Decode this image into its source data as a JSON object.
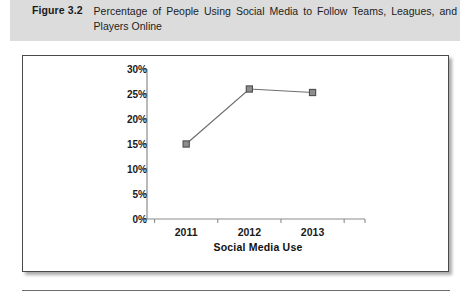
{
  "figure": {
    "label": "Figure 3.2",
    "caption": "Percentage of People Using Social Media to Follow Teams, Leagues, and Players Online"
  },
  "chart_data": {
    "type": "line",
    "title": "",
    "categories": [
      "2011",
      "2012",
      "2013"
    ],
    "values": [
      15,
      26,
      25.3
    ],
    "series": [
      {
        "name": "Social Media Use",
        "values": [
          15,
          26,
          25.3
        ]
      }
    ],
    "xlabel": "Social Media Use",
    "ylabel": "",
    "ylim": [
      0,
      30
    ],
    "ytick_labels": [
      "0%",
      "5%",
      "10%",
      "15%",
      "20%",
      "25%",
      "30%"
    ],
    "ytick_values": [
      0,
      5,
      10,
      15,
      20,
      25,
      30
    ],
    "grid": false,
    "legend": "none",
    "marker": "square",
    "line_color": "#6e6e6e",
    "marker_fill": "#8d8d8d",
    "marker_border": "#4d4d4d",
    "axis_color": "#8b8b8b"
  },
  "style": {
    "caption_band_color": "#dcdcdc",
    "chart_border_color": "#4a4a4a",
    "rule_color": "#6b6b6b"
  }
}
